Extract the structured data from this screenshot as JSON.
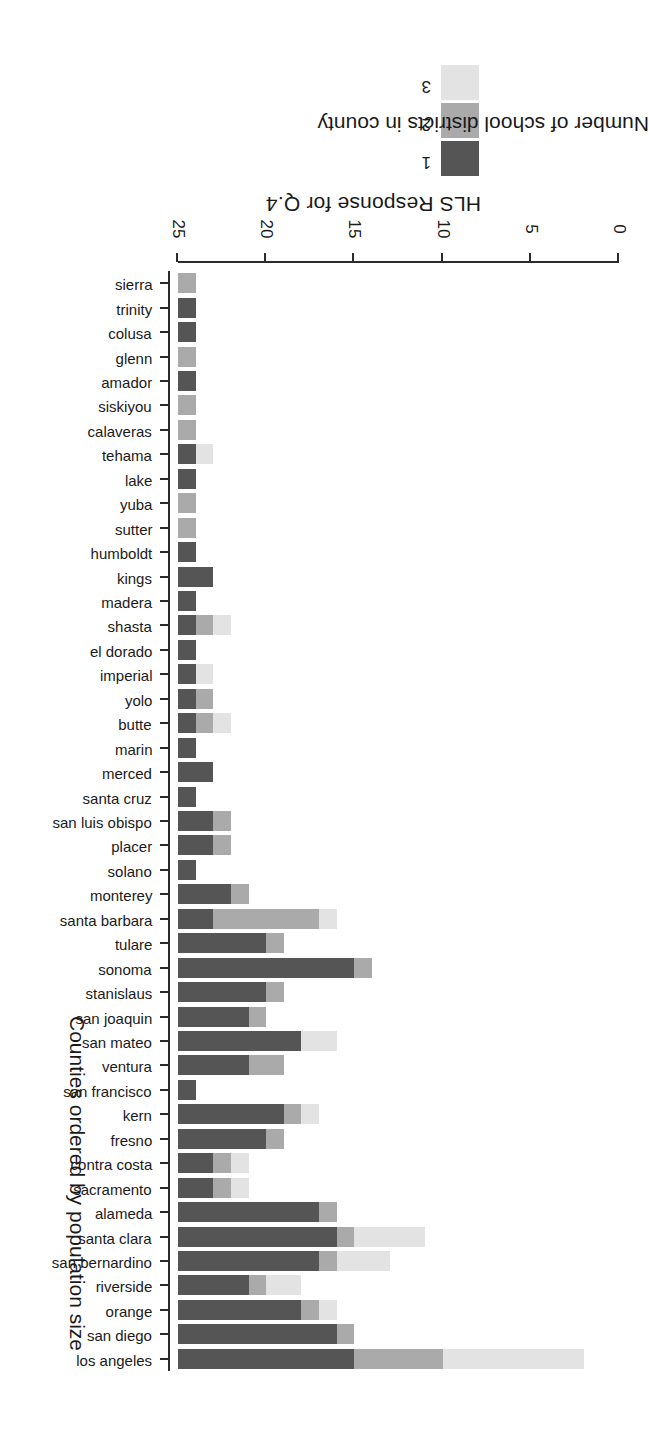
{
  "chart_data": {
    "type": "bar",
    "subtype": "stacked-horizontal",
    "title": "",
    "xlabel": "Number of school districts in county",
    "ylabel": "Counties ordered by population size",
    "xlim": [
      0,
      25
    ],
    "xticks": [
      0,
      5,
      10,
      15,
      20,
      25
    ],
    "grid": false,
    "orientation": "horizontal",
    "page_rotation_deg": 180,
    "legend": {
      "title": "HLS Response for Q.4",
      "position": "top-left",
      "entries": [
        {
          "label": "1",
          "color": "#555555"
        },
        {
          "label": "2",
          "color": "#aaaaaa"
        },
        {
          "label": "3",
          "color": "#e3e3e3"
        }
      ]
    },
    "categories": [
      "los angeles",
      "san diego",
      "orange",
      "riverside",
      "san bernardino",
      "santa clara",
      "alameda",
      "sacramento",
      "contra costa",
      "fresno",
      "kern",
      "san francisco",
      "ventura",
      "san mateo",
      "san joaquin",
      "stanislaus",
      "sonoma",
      "tulare",
      "santa barbara",
      "monterey",
      "solano",
      "placer",
      "san luis obispo",
      "santa cruz",
      "merced",
      "marin",
      "butte",
      "yolo",
      "imperial",
      "el dorado",
      "shasta",
      "madera",
      "kings",
      "humboldt",
      "sutter",
      "yuba",
      "lake",
      "tehama",
      "calaveras",
      "siskiyou",
      "amador",
      "glenn",
      "colusa",
      "trinity",
      "sierra"
    ],
    "series": [
      {
        "name": "1",
        "color": "#555555",
        "values": [
          10,
          9,
          7,
          4,
          8,
          9,
          8,
          2,
          2,
          5,
          6,
          1,
          4,
          7,
          4,
          5,
          10,
          5,
          2,
          3,
          1,
          2,
          2,
          1,
          2,
          1,
          1,
          1,
          1,
          1,
          1,
          1,
          2,
          1,
          0,
          0,
          1,
          1,
          0,
          0,
          1,
          0,
          1,
          1,
          0
        ]
      },
      {
        "name": "2",
        "color": "#aaaaaa",
        "values": [
          5,
          1,
          1,
          1,
          1,
          1,
          1,
          1,
          1,
          1,
          1,
          0,
          2,
          0,
          1,
          1,
          1,
          1,
          6,
          1,
          0,
          1,
          1,
          0,
          0,
          0,
          1,
          1,
          0,
          0,
          1,
          0,
          0,
          0,
          1,
          1,
          0,
          0,
          1,
          1,
          0,
          1,
          0,
          0,
          1
        ]
      },
      {
        "name": "3",
        "color": "#e3e3e3",
        "values": [
          8,
          0,
          1,
          2,
          3,
          4,
          0,
          1,
          1,
          0,
          1,
          0,
          0,
          2,
          0,
          0,
          0,
          0,
          1,
          0,
          0,
          0,
          0,
          0,
          0,
          0,
          1,
          0,
          1,
          0,
          1,
          0,
          0,
          0,
          0,
          0,
          0,
          1,
          0,
          0,
          0,
          0,
          0,
          0,
          0
        ]
      }
    ],
    "totals": [
      23,
      10,
      9,
      7,
      12,
      14,
      9,
      4,
      4,
      6,
      8,
      1,
      6,
      9,
      5,
      6,
      11,
      6,
      9,
      4,
      1,
      3,
      3,
      1,
      2,
      1,
      3,
      2,
      2,
      1,
      3,
      1,
      2,
      1,
      1,
      1,
      1,
      2,
      1,
      1,
      1,
      1,
      1,
      1,
      1
    ]
  }
}
